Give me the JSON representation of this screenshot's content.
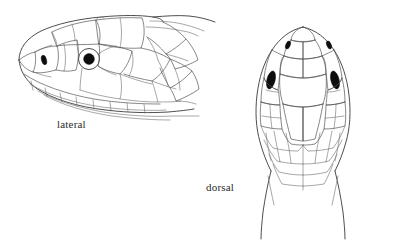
{
  "figure": {
    "title": "",
    "background_color": "#ffffff",
    "line_color": "#3a3a3a",
    "fill_color": "#0d0d0d",
    "views": [
      {
        "id": "lateral",
        "label": "lateral",
        "position": "left",
        "features": [
          "eye",
          "nostril",
          "supralabial-scales",
          "infralabial-scales",
          "parietal-scales",
          "temporal-scales",
          "neck"
        ]
      },
      {
        "id": "dorsal",
        "label": "dorsal",
        "position": "right",
        "features": [
          "rostral",
          "internasals",
          "prefrontals",
          "frontal",
          "parietals",
          "eyes",
          "nostrils",
          "nuchal-scales",
          "neck"
        ]
      }
    ]
  },
  "labels": {
    "lateral": "lateral",
    "dorsal": "dorsal"
  }
}
